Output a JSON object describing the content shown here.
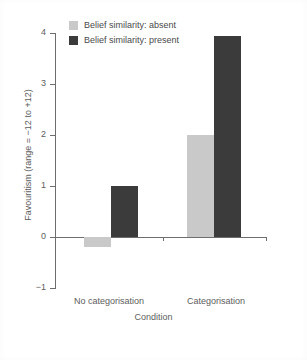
{
  "chart_data": {
    "type": "bar",
    "title": "",
    "subtitle": "",
    "xlabel": "Condition",
    "ylabel": "Favouritism (range = −12 to +12)",
    "categories": [
      "No categorisation",
      "Categorisation"
    ],
    "series": [
      {
        "name": "Belief similarity: absent",
        "color": "#c9c9c9",
        "values": [
          -0.2,
          2.0
        ]
      },
      {
        "name": "Belief similarity: present",
        "color": "#3b3b3b",
        "values": [
          1.0,
          3.95
        ]
      }
    ],
    "ylim": [
      -1,
      4
    ],
    "yticks": [
      4,
      3,
      2,
      1,
      0,
      -1
    ],
    "ytick_labels": [
      "4",
      "3",
      "2",
      "1",
      "0",
      "−1"
    ],
    "grid": false,
    "legend_position": "top-left",
    "orientation": "vertical",
    "bar_group_gap": true
  },
  "legend": {
    "items": [
      {
        "label": "Belief similarity: absent",
        "swatch": "#c9c9c9"
      },
      {
        "label": "Belief similarity: present",
        "swatch": "#3b3b3b"
      }
    ]
  },
  "axes": {
    "y_label": "Favouritism (range = −12 to +12)",
    "x_label": "Condition",
    "y_tick_labels": [
      "4",
      "3",
      "2",
      "1",
      "0",
      "−1"
    ],
    "x_tick_labels": [
      "No categorisation",
      "Categorisation"
    ]
  },
  "figure": {
    "background": "#ffffff",
    "axis_color": "#6e6e6e",
    "text_color": "#5d5d5d"
  }
}
